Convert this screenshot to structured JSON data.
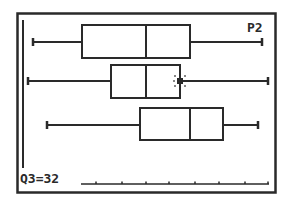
{
  "screen": {
    "plot_label": "P2",
    "status_text": "Q3=32",
    "colors": {
      "ink": "#2a2a2a",
      "background": "#ffffff"
    }
  },
  "chart_data": {
    "type": "boxplot",
    "title": "",
    "xlabel": "",
    "ylabel": "",
    "grid": false,
    "trace_readout": "Q3=32",
    "selected_plot": "P2",
    "pixel_scale": {
      "x_min_px": 17,
      "x_max_px": 276
    },
    "series": [
      {
        "name": "P1",
        "whisker_left_px": 33,
        "q1_px": 82,
        "median_px": 146,
        "q3_px": 190,
        "whisker_right_px": 262,
        "y_center_px": 42,
        "box_top_px": 25,
        "box_bottom_px": 58
      },
      {
        "name": "P2",
        "whisker_left_px": 28,
        "q1_px": 111,
        "median_px": 146,
        "q3_px": 180,
        "whisker_right_px": 268,
        "y_center_px": 81,
        "box_top_px": 65,
        "box_bottom_px": 98,
        "cursor_at": "q3",
        "q3_value": 32
      },
      {
        "name": "P3",
        "whisker_left_px": 47,
        "q1_px": 140,
        "median_px": 190,
        "q3_px": 223,
        "whisker_right_px": 258,
        "y_center_px": 125,
        "box_top_px": 108,
        "box_bottom_px": 140
      }
    ],
    "x_axis": {
      "y_px": 184,
      "from_px": 81,
      "to_px": 269,
      "ticks_px": [
        96,
        122,
        146,
        169,
        195,
        219,
        245,
        268
      ]
    }
  }
}
